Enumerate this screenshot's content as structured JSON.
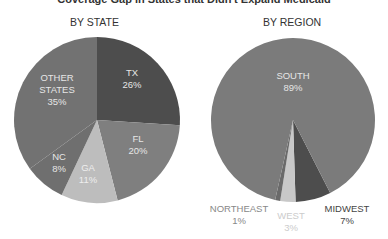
{
  "chart_data": [
    {
      "type": "pie",
      "title": "BY STATE",
      "center": [
        97,
        120
      ],
      "radius": 83,
      "start_angle": 0,
      "slices": [
        {
          "label": "TX",
          "value": 26,
          "pct": "26%",
          "color": "#4d4d4d",
          "text_color": "#e6e6e6",
          "lx": 132,
          "ly": 82
        },
        {
          "label": "FL",
          "value": 20,
          "pct": "20%",
          "color": "#7f7f7f",
          "text_color": "#e6e6e6",
          "lx": 138,
          "ly": 148
        },
        {
          "label": "GA",
          "value": 11,
          "pct": "11%",
          "color": "#bdbdbd",
          "text_color": "#eeeeee",
          "lx": 88,
          "ly": 177
        },
        {
          "label": "NC",
          "value": 8,
          "pct": "8%",
          "color": "#6f6f6f",
          "text_color": "#e6e6e6",
          "lx": 59,
          "ly": 166
        },
        {
          "label": "OTHER\nSTATES",
          "value": 35,
          "pct": "35%",
          "color": "#727272",
          "text_color": "#e6e6e6",
          "lx": 57,
          "ly": 93
        }
      ]
    },
    {
      "type": "pie",
      "title": "BY REGION",
      "center": [
        293,
        120
      ],
      "radius": 82,
      "start_angle": 153,
      "slices": [
        {
          "label": "MIDWEST",
          "value": 7,
          "pct": "7%",
          "color": "#4d4d4d",
          "text_color": "#444444",
          "lx": 347,
          "ly": 218,
          "outside": true
        },
        {
          "label": "WEST",
          "value": 3,
          "pct": "3%",
          "color": "#c8c8c8",
          "text_color": "#cccccc",
          "lx": 291,
          "ly": 225,
          "outside": true
        },
        {
          "label": "NORTHEAST",
          "value": 1,
          "pct": "1%",
          "color": "#6a6a6a",
          "text_color": "#888888",
          "lx": 239,
          "ly": 218,
          "outside": true
        },
        {
          "label": "SOUTH",
          "value": 89,
          "pct": "89%",
          "color": "#7b7b7b",
          "text_color": "#e6e6e6",
          "lx": 293,
          "ly": 85
        }
      ]
    }
  ],
  "header": {
    "title": "Coverage Gap in States that Didn't Expand Medicaid",
    "left_subtitle": "BY STATE",
    "right_subtitle": "BY REGION"
  }
}
